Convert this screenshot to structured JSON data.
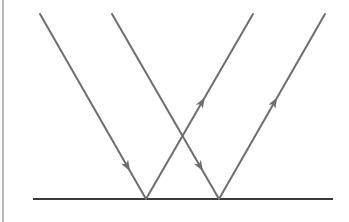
{
  "diagram": {
    "type": "reflection",
    "colors": {
      "ray": "#6e6e6e",
      "surface": "#3a3a3a",
      "edge": "#b8b8b8",
      "background": "#ffffff"
    },
    "surface": {
      "x1": 33,
      "y1": 199,
      "x2": 333,
      "y2": 199
    },
    "rays": [
      {
        "id": "incident-1",
        "kind": "incident",
        "from": [
          40,
          14
        ],
        "to": [
          146,
          199
        ],
        "arrow_at": 0.85
      },
      {
        "id": "incident-2",
        "kind": "incident",
        "from": [
          112,
          14
        ],
        "to": [
          219,
          199
        ],
        "arrow_at": 0.85
      },
      {
        "id": "reflected-1",
        "kind": "reflected",
        "from": [
          146,
          199
        ],
        "to": [
          253,
          14
        ],
        "arrow_at": 0.55
      },
      {
        "id": "reflected-2",
        "kind": "reflected",
        "from": [
          219,
          199
        ],
        "to": [
          325,
          14
        ],
        "arrow_at": 0.55
      }
    ]
  }
}
